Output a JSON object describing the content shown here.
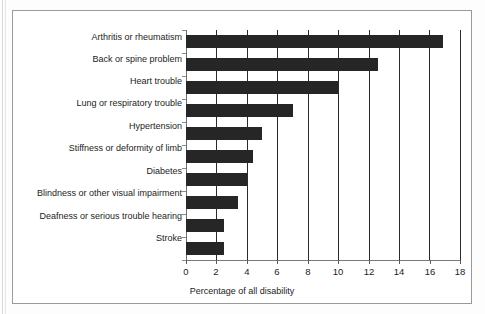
{
  "chart_data": {
    "type": "bar",
    "orientation": "horizontal",
    "title": "",
    "xlabel": "Percentage of all disability",
    "ylabel": "",
    "xlim": [
      0,
      18
    ],
    "xticks": [
      0,
      2,
      4,
      6,
      8,
      10,
      12,
      14,
      16,
      18
    ],
    "grid": "vertical",
    "legend": "none",
    "bar_color": "#262626",
    "categories": [
      "Arthritis or rheumatism",
      "Back or spine problem",
      "Heart trouble",
      "Lung or respiratory trouble",
      "Hypertension",
      "Stiffness or deformity of limb",
      "Diabetes",
      "Blindness or other visual impairment",
      "Deafness or serious trouble hearing",
      "Stroke"
    ],
    "values": [
      16.9,
      12.6,
      10.0,
      7.0,
      5.0,
      4.4,
      4.0,
      3.4,
      2.5,
      2.5
    ]
  },
  "figure": {
    "frame_color": "#9a9a9a",
    "background": "#ffffff"
  }
}
